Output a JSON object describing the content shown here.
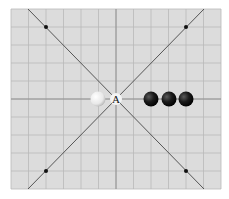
{
  "diagram": {
    "type": "go-board-fragment",
    "board": {
      "left": 11,
      "top": 9,
      "right": 221,
      "bottom": 189,
      "cols": 12,
      "rows": 10,
      "background": "#dcdcdc",
      "grid_color": "#b4b4b4"
    },
    "center_point": {
      "label": "A",
      "x": 116,
      "y": 99
    },
    "stones": [
      {
        "color": "white",
        "x": 98,
        "y": 99
      },
      {
        "color": "black",
        "x": 151,
        "y": 99
      },
      {
        "color": "black",
        "x": 169,
        "y": 99
      },
      {
        "color": "black",
        "x": 186,
        "y": 99
      }
    ],
    "diagonal_markers": [
      {
        "x": 46,
        "y": 27
      },
      {
        "x": 186,
        "y": 27
      },
      {
        "x": 46,
        "y": 171
      },
      {
        "x": 186,
        "y": 171
      }
    ],
    "caption": ""
  }
}
